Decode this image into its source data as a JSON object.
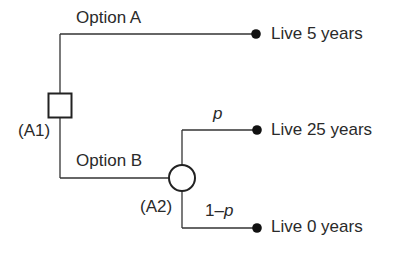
{
  "diagram": {
    "type": "decision-tree",
    "decision_node": {
      "id": "A1",
      "label": "(A1)",
      "shape": "square"
    },
    "chance_node": {
      "id": "A2",
      "label": "(A2)",
      "shape": "circle"
    },
    "branches": {
      "option_a": {
        "label": "Option A",
        "outcome": "Live 5 years"
      },
      "option_b": {
        "label": "Option B"
      },
      "chance_p": {
        "label": "p",
        "outcome": "Live 25 years"
      },
      "chance_1mp": {
        "label_prefix": "1–",
        "label_var": "p",
        "outcome": "Live 0 years"
      }
    },
    "colors": {
      "line": "#333333",
      "terminal": "#111111",
      "text": "#2a2a2a"
    }
  }
}
